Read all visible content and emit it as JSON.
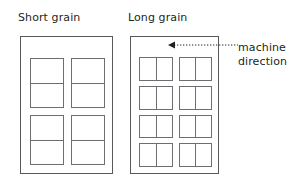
{
  "figure": {
    "kind": "paper-grain-direction-diagram",
    "background_color": "#ffffff",
    "line_color": "#58595b",
    "block_line_color": "#6d6e71",
    "text_color": "#231f20",
    "panels": [
      {
        "id": "short-grain",
        "title": "Short grain",
        "arrow_icon": "triangle-left-icon",
        "arrow_direction": "left",
        "sheet": {
          "columns": 2,
          "rows": 2,
          "blocks": 4,
          "block_split": "horizontal",
          "cells_per_block": 2,
          "total_cells": 8
        }
      },
      {
        "id": "long-grain",
        "title": "Long grain",
        "arrow_icon": "triangle-up-icon",
        "arrow_direction": "up",
        "sheet": {
          "columns": 2,
          "rows": 4,
          "blocks": 8,
          "block_split": "vertical",
          "cells_per_block": 2,
          "total_cells": 16
        }
      }
    ],
    "callout": {
      "label": "machine direction",
      "leader_style": "dotted",
      "leader_arrowhead": "arrowhead-left-icon"
    }
  }
}
